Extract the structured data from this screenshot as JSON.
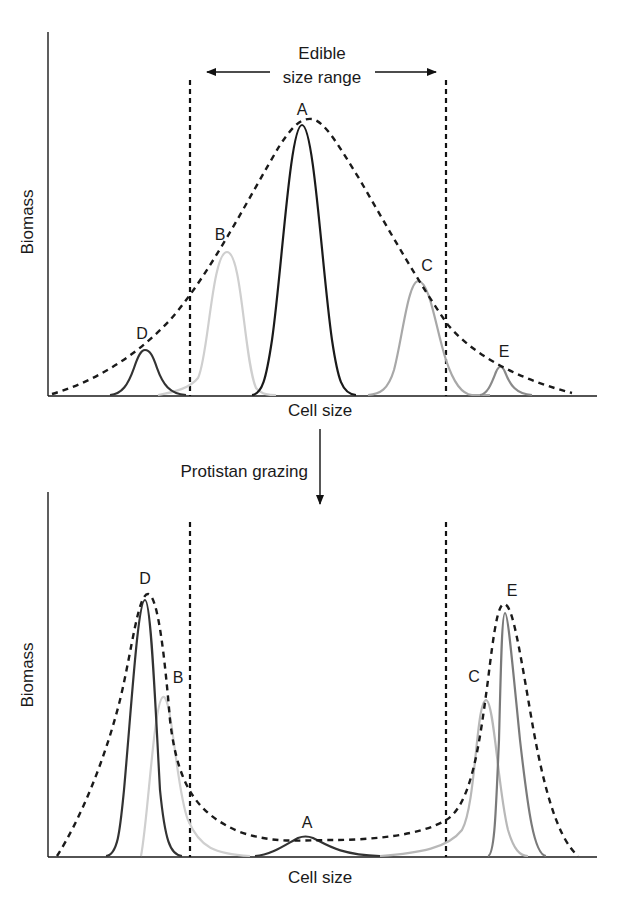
{
  "top_panel": {
    "y_label": "Biomass",
    "x_label": "Cell size",
    "range_label_line1": "Edible",
    "range_label_line2": "size range",
    "peaks": [
      {
        "label": "D",
        "color": "#333333"
      },
      {
        "label": "B",
        "color": "#cfcfcf"
      },
      {
        "label": "A",
        "color": "#1a1a1a"
      },
      {
        "label": "C",
        "color": "#a8a8a8"
      },
      {
        "label": "E",
        "color": "#8a8a8a"
      }
    ]
  },
  "transition": {
    "label": "Protistan grazing"
  },
  "bottom_panel": {
    "y_label": "Biomass",
    "x_label": "Cell size",
    "peaks": [
      {
        "label": "D",
        "color": "#333333"
      },
      {
        "label": "B",
        "color": "#cfcfcf"
      },
      {
        "label": "A",
        "color": "#333333"
      },
      {
        "label": "C",
        "color": "#b8b8b8"
      },
      {
        "label": "E",
        "color": "#7a7a7a"
      }
    ]
  },
  "colors": {
    "axis": "#1a1a1a",
    "envelope": "#1a1a1a",
    "background": "#ffffff"
  }
}
